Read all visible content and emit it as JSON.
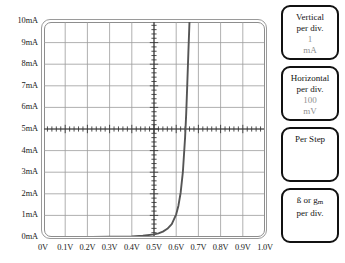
{
  "chart_data": {
    "type": "line",
    "title": "",
    "xlabel": "",
    "ylabel": "",
    "xlim": [
      0,
      1.0
    ],
    "ylim": [
      0,
      10
    ],
    "grid": true,
    "legend": "none",
    "x_tick_labels": [
      "0V",
      "0.1V",
      "0.2V",
      "0.3V",
      "0.4V",
      "0.5V",
      "0.6V",
      "0.7V",
      "0.8V",
      "0.9V",
      "1.0V"
    ],
    "y_tick_labels": [
      "0mA",
      "1mA",
      "2mA",
      "3mA",
      "4mA",
      "5mA",
      "6mA",
      "7mA",
      "8mA",
      "9mA",
      "10mA"
    ],
    "x_units": "V",
    "y_units": "mA",
    "x_per_div": 0.1,
    "y_per_div": 1,
    "series": [
      {
        "name": "diode-forward-curve",
        "color": "#555555",
        "x": [
          0.0,
          0.1,
          0.2,
          0.3,
          0.4,
          0.45,
          0.5,
          0.52,
          0.54,
          0.56,
          0.58,
          0.6,
          0.61,
          0.62,
          0.63,
          0.64,
          0.645,
          0.65,
          0.655,
          0.66
        ],
        "y": [
          0.0,
          0.0,
          0.0,
          0.01,
          0.03,
          0.06,
          0.12,
          0.17,
          0.25,
          0.38,
          0.6,
          1.05,
          1.45,
          2.05,
          3.0,
          4.6,
          5.7,
          7.1,
          8.6,
          10.0
        ]
      }
    ]
  },
  "axes": {
    "y_labels": [
      "10mA",
      "9mA",
      "8mA",
      "7mA",
      "6mA",
      "5mA",
      "4mA",
      "3mA",
      "2mA",
      "1mA",
      "0mA"
    ],
    "x_labels": [
      "0V",
      "0.1V",
      "0.2V",
      "0.3V",
      "0.4V",
      "0.5V",
      "0.6V",
      "0.7V",
      "0.8V",
      "0.9V",
      "1.0V"
    ]
  },
  "panels": [
    {
      "id": "vertical",
      "line1": "Vertical",
      "line2": "per div.",
      "value": "1",
      "unit": "mA"
    },
    {
      "id": "horizontal",
      "line1": "Horizontal",
      "line2": "per div.",
      "value": "100",
      "unit": "mV"
    },
    {
      "id": "per-step",
      "line1": "Per Step",
      "line2": "",
      "value": "",
      "unit": ""
    },
    {
      "id": "beta-gm",
      "line1_prefix": "ß or ",
      "line1_sym": "g",
      "line1_sub": "m",
      "line2": "per div.",
      "value": "",
      "unit": ""
    }
  ],
  "colors": {
    "curve": "#555555",
    "grid_major": "#9c9c9c",
    "grid_minor": "#bdbdbd",
    "axis": "#333333",
    "frame": "#8d8d8d",
    "panel_border": "#111111",
    "panel_value_text": "#8f8f8f",
    "text": "#141414"
  }
}
